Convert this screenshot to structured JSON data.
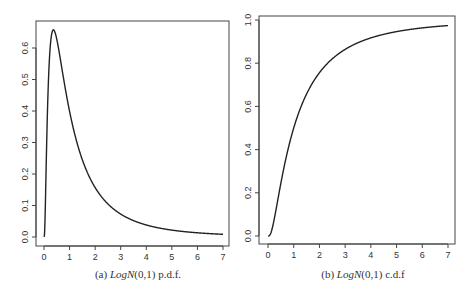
{
  "chart_data": [
    {
      "type": "line",
      "title": "",
      "caption": {
        "prefix": "(a)",
        "dist": "LogN",
        "params": "(0,1)",
        "suffix": "p.d.f."
      },
      "xlabel": "",
      "ylabel": "",
      "xlim": [
        0,
        7
      ],
      "ylim": [
        0,
        0.66
      ],
      "xticks": [
        0,
        1,
        2,
        3,
        4,
        5,
        6,
        7
      ],
      "yticks": [
        0.0,
        0.1,
        0.2,
        0.3,
        0.4,
        0.5,
        0.6
      ],
      "ytick_labels": [
        "0.0",
        "0.1",
        "0.2",
        "0.3",
        "0.4",
        "0.5",
        "0.6"
      ],
      "grid": false,
      "series": [
        {
          "name": "LogN(0,1) pdf",
          "function": "lognormal_pdf",
          "mu": 0,
          "sigma": 1,
          "x": [
            0.01,
            0.1,
            0.2,
            0.37,
            0.5,
            1,
            1.5,
            2,
            2.5,
            3,
            4,
            5,
            6,
            7
          ],
          "y": [
            0.0,
            0.28,
            0.55,
            0.66,
            0.63,
            0.4,
            0.25,
            0.16,
            0.1,
            0.07,
            0.04,
            0.02,
            0.015,
            0.011
          ]
        }
      ]
    },
    {
      "type": "line",
      "title": "",
      "caption": {
        "prefix": "(b)",
        "dist": "LogN",
        "params": "(0,1)",
        "suffix": "c.d.f"
      },
      "xlabel": "",
      "ylabel": "",
      "xlim": [
        0,
        7
      ],
      "ylim": [
        0,
        1.0
      ],
      "xticks": [
        0,
        1,
        2,
        3,
        4,
        5,
        6,
        7
      ],
      "yticks": [
        0.0,
        0.2,
        0.4,
        0.6,
        0.8,
        1.0
      ],
      "ytick_labels": [
        "0.0",
        "0.2",
        "0.4",
        "0.6",
        "0.8",
        "1.0"
      ],
      "grid": false,
      "series": [
        {
          "name": "LogN(0,1) cdf",
          "function": "lognormal_cdf",
          "mu": 0,
          "sigma": 1,
          "x": [
            0.01,
            0.2,
            0.5,
            1,
            1.5,
            2,
            3,
            4,
            5,
            6,
            7
          ],
          "y": [
            0.0,
            0.05,
            0.24,
            0.5,
            0.66,
            0.76,
            0.86,
            0.92,
            0.95,
            0.96,
            0.97
          ]
        }
      ]
    }
  ]
}
